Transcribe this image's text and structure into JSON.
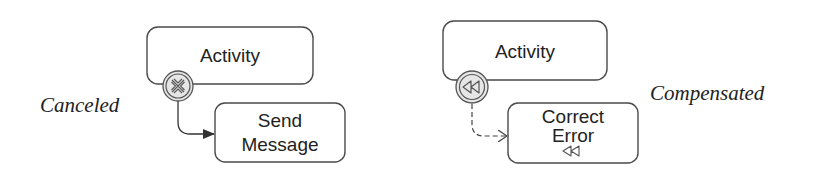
{
  "diagram": {
    "left": {
      "caption": "Canceled",
      "main_activity": "Activity",
      "boundary_event": "cancel-event",
      "handler_activity_line1": "Send",
      "handler_activity_line2": "Message",
      "connector": "sequence-flow"
    },
    "right": {
      "caption": "Compensated",
      "main_activity": "Activity",
      "boundary_event": "compensation-event",
      "handler_activity_line1": "Correct",
      "handler_activity_line2": "Error",
      "handler_marker": "compensation-marker",
      "connector": "association-dashed"
    },
    "colors": {
      "stroke": "#4a4a4a",
      "event_fill": "#e8e8e8",
      "text": "#222222"
    }
  }
}
